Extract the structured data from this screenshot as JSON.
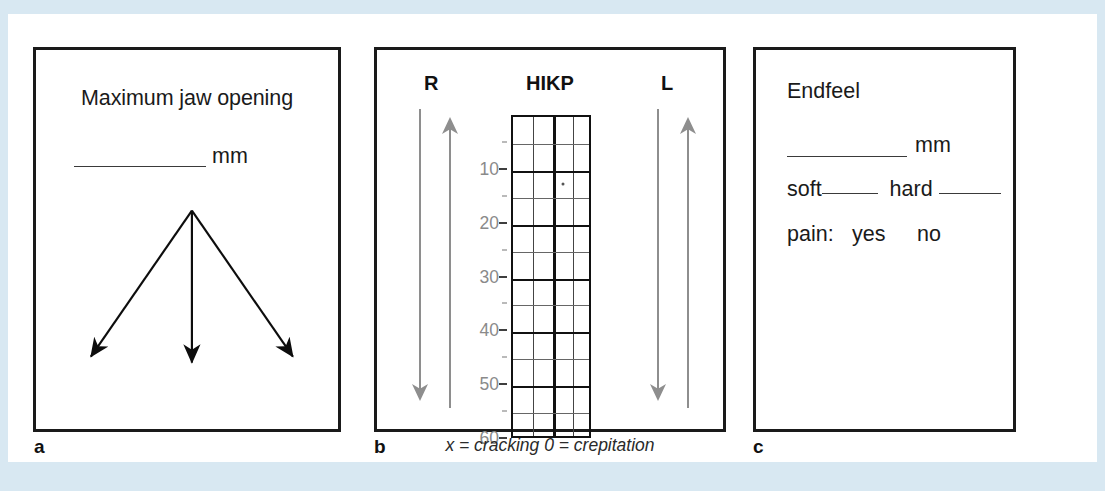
{
  "figure": {
    "background_color": "#ffffff",
    "page_border_color": "#d8e8f2"
  },
  "panel_a": {
    "letter": "a",
    "title": "Maximum jaw opening",
    "mm_unit": "mm",
    "blank_label": "",
    "arrows": [
      {
        "name": "left-lateral-arrow",
        "direction": "down-left"
      },
      {
        "name": "protrusive-arrow",
        "direction": "down"
      },
      {
        "name": "right-lateral-arrow",
        "direction": "down-right"
      }
    ]
  },
  "panel_b": {
    "letter": "b",
    "heading_right": "R",
    "heading_center": "HIKP",
    "heading_left": "L",
    "caption": "x = cracking   0 = crepitation",
    "scale_labels": [
      "10",
      "20",
      "30",
      "40",
      "50",
      "60"
    ],
    "scale_color": "#8a8a8a",
    "arrow_color": "#8e8e8e",
    "grid": {
      "columns": 4,
      "rows": 12,
      "row_step_mm": 5,
      "range_mm": [
        0,
        60
      ],
      "center_divider": true,
      "marks": [
        {
          "column": 3,
          "mm": 12.5
        }
      ]
    }
  },
  "panel_c": {
    "letter": "c",
    "title": "Endfeel",
    "mm_unit": "mm",
    "endfeel_soft": "soft",
    "endfeel_hard": "hard",
    "pain_label": "pain:",
    "pain_yes": "yes",
    "pain_no": "no"
  }
}
